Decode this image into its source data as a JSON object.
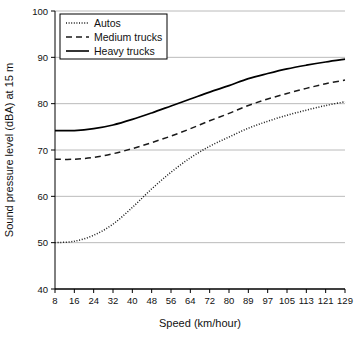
{
  "chart_data": {
    "type": "line",
    "title": "",
    "xlabel": "Speed (km/hour)",
    "ylabel": "Sound pressure level (dBA) at 15 m",
    "xlim": [
      8,
      129
    ],
    "ylim": [
      40,
      100
    ],
    "grid": true,
    "legend_position": "top-left",
    "xticks": [
      8,
      16,
      24,
      32,
      40,
      48,
      56,
      64,
      72,
      80,
      89,
      97,
      105,
      113,
      121,
      129
    ],
    "xtick_labels": [
      "8",
      "16",
      "24",
      "32",
      "40",
      "48",
      "56",
      "64",
      "72",
      "80",
      "89",
      "97",
      "105",
      "113",
      "121",
      "129"
    ],
    "yticks": [
      40,
      50,
      60,
      70,
      80,
      90,
      100
    ],
    "ytick_labels": [
      "40",
      "50",
      "60",
      "70",
      "80",
      "90",
      "100"
    ],
    "x": [
      8,
      16,
      24,
      32,
      40,
      48,
      56,
      64,
      72,
      80,
      89,
      97,
      105,
      113,
      121,
      129
    ],
    "series": [
      {
        "name": "Autos",
        "style": "dotted",
        "color": "#1a1a1a",
        "values": [
          50.0,
          50.3,
          51.6,
          54.0,
          57.6,
          61.6,
          65.2,
          68.3,
          70.8,
          72.8,
          74.7,
          76.2,
          77.5,
          78.6,
          79.6,
          80.4
        ]
      },
      {
        "name": "Medium trucks",
        "style": "dashed",
        "color": "#1a1a1a",
        "values": [
          68.0,
          68.0,
          68.4,
          69.2,
          70.3,
          71.6,
          73.0,
          74.6,
          76.3,
          77.9,
          79.6,
          81.0,
          82.2,
          83.3,
          84.3,
          85.1
        ]
      },
      {
        "name": "Heavy trucks",
        "style": "solid",
        "color": "#000000",
        "values": [
          74.2,
          74.2,
          74.6,
          75.4,
          76.6,
          78.0,
          79.5,
          81.0,
          82.5,
          83.9,
          85.4,
          86.5,
          87.5,
          88.3,
          89.0,
          89.6
        ]
      }
    ]
  },
  "legend": {
    "items": [
      {
        "label": "Autos"
      },
      {
        "label": "Medium trucks"
      },
      {
        "label": "Heavy trucks"
      }
    ]
  },
  "axes": {
    "y_title": "Sound pressure level (dBA) at 15 m",
    "x_title": "Speed (km/hour)"
  }
}
